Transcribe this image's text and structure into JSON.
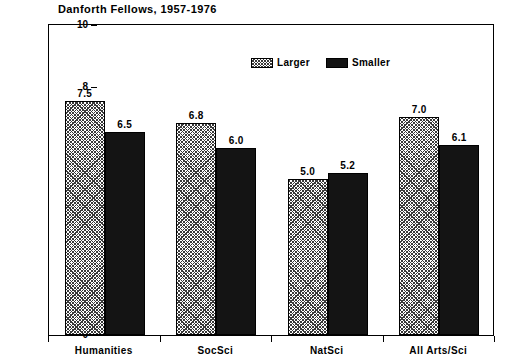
{
  "chart_data": {
    "type": "bar",
    "title": "Danforth Fellows, 1957-1976",
    "xlabel": "",
    "ylabel": "Median ETD",
    "ylim": [
      0,
      10
    ],
    "yticks": [
      0,
      2,
      4,
      6,
      8,
      10
    ],
    "ytick_labels": [
      "0",
      "2",
      "4",
      "6",
      "8",
      "10"
    ],
    "grid": false,
    "legend_position": "top-center",
    "categories": [
      "Humanities",
      "SocSci",
      "NatSci",
      "All Arts/Sci"
    ],
    "series": [
      {
        "name": "Larger",
        "fill": "hatched",
        "color": "#ffffff",
        "values": [
          7.5,
          6.8,
          5.0,
          7.0
        ],
        "labels": [
          "7.5",
          "6.8",
          "5.0",
          "7.0"
        ]
      },
      {
        "name": "Smaller",
        "fill": "solid",
        "color": "#141414",
        "values": [
          6.5,
          6.0,
          5.2,
          6.1
        ],
        "labels": [
          "6.5",
          "6.0",
          "5.2",
          "6.1"
        ]
      }
    ]
  },
  "legend": {
    "entries": [
      {
        "label": "Larger"
      },
      {
        "label": "Smaller"
      }
    ]
  }
}
